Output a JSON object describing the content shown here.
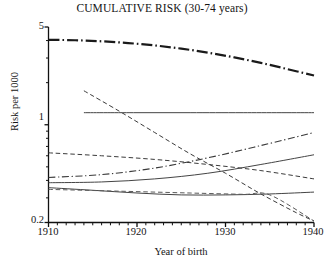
{
  "chart_data": {
    "type": "line",
    "title": "CUMULATIVE RISK (30-74 years)",
    "xlabel": "Year of birth",
    "ylabel": "Risk per 1000",
    "xlim": [
      1910,
      1940
    ],
    "ylim": [
      0.2,
      5
    ],
    "yscale": "log",
    "grid": false,
    "legend": null,
    "x_ticks": [
      1910,
      1920,
      1930,
      1940
    ],
    "x_tick_labels": [
      "1910",
      "1920",
      "1930",
      "1940"
    ],
    "x_minor_tick_step": 1,
    "y_ticks": [
      0.2,
      1,
      5
    ],
    "y_tick_labels": [
      "0.2",
      "1",
      "5"
    ],
    "series": [
      {
        "name": "series-1-top-thick-dashdot",
        "style": "dashdot",
        "width": 2.2,
        "color": "#1a1a1a",
        "x": [
          1910,
          1913,
          1916,
          1919,
          1922,
          1925,
          1928,
          1931,
          1934,
          1937,
          1940
        ],
        "y": [
          4.05,
          4.02,
          3.95,
          3.84,
          3.69,
          3.5,
          3.28,
          3.03,
          2.77,
          2.5,
          2.25
        ]
      },
      {
        "name": "series-2-flat-solid",
        "style": "solid",
        "width": 1.0,
        "color": "#444444",
        "x": [
          1914,
          1920,
          1926,
          1932,
          1940
        ],
        "y": [
          1.22,
          1.22,
          1.22,
          1.22,
          1.22
        ]
      },
      {
        "name": "series-3-steep-dashed-decline",
        "style": "dashed",
        "width": 1.0,
        "color": "#3a3a3a",
        "x": [
          1914,
          1918,
          1922,
          1926,
          1930,
          1934,
          1938,
          1940
        ],
        "y": [
          1.75,
          1.25,
          0.88,
          0.62,
          0.45,
          0.32,
          0.235,
          0.205
        ]
      },
      {
        "name": "series-4-dashed-upper",
        "style": "dashed",
        "width": 1.0,
        "color": "#3a3a3a",
        "x": [
          1910,
          1916,
          1922,
          1928,
          1934,
          1940
        ],
        "y": [
          0.63,
          0.6,
          0.565,
          0.52,
          0.47,
          0.41
        ]
      },
      {
        "name": "series-5-rising-dashdot",
        "style": "dashdot",
        "width": 1.1,
        "color": "#3a3a3a",
        "x": [
          1910,
          1916,
          1922,
          1928,
          1934,
          1940
        ],
        "y": [
          0.42,
          0.44,
          0.49,
          0.58,
          0.71,
          0.88
        ]
      },
      {
        "name": "series-6-rising-solid",
        "style": "solid",
        "width": 1.0,
        "color": "#444444",
        "x": [
          1910,
          1916,
          1922,
          1928,
          1934,
          1940
        ],
        "y": [
          0.385,
          0.39,
          0.41,
          0.45,
          0.52,
          0.61
        ]
      },
      {
        "name": "series-7-lower-solid-curve",
        "style": "solid",
        "width": 1.0,
        "color": "#444444",
        "x": [
          1910,
          1915,
          1920,
          1925,
          1930,
          1935,
          1940
        ],
        "y": [
          0.355,
          0.34,
          0.325,
          0.315,
          0.315,
          0.32,
          0.33
        ]
      },
      {
        "name": "series-8-flat-then-drop-dashed",
        "style": "dashed",
        "width": 1.0,
        "color": "#5a5a5a",
        "x": [
          1910,
          1918,
          1926,
          1932,
          1935,
          1940
        ],
        "y": [
          0.345,
          0.335,
          0.325,
          0.318,
          0.315,
          0.205
        ]
      }
    ]
  },
  "axes": {
    "title": "CUMULATIVE RISK (30-74 years)",
    "ylabel": "Risk per 1000",
    "xlabel": "Year of birth",
    "y_labels": [
      "5",
      "1",
      "0.2"
    ],
    "x_labels": [
      "1910",
      "1920",
      "1930",
      "1940"
    ]
  }
}
